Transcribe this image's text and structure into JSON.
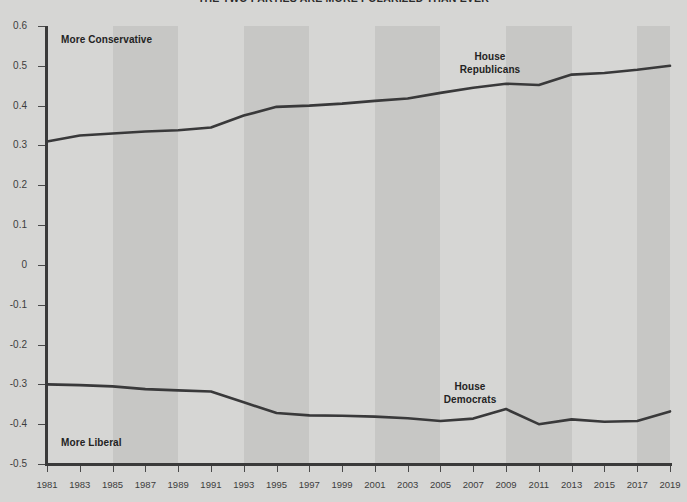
{
  "chart_data": {
    "type": "line",
    "title": "THE TWO PARTIES ARE MORE POLARIZED THAN EVER",
    "xlabel": "",
    "ylabel": "",
    "xlim": [
      1981,
      2019
    ],
    "ylim": [
      -0.5,
      0.6
    ],
    "grid": false,
    "legend_position": "inline-annotation",
    "x": [
      1981,
      1983,
      1985,
      1987,
      1989,
      1991,
      1993,
      1995,
      1997,
      1999,
      2001,
      2003,
      2005,
      2007,
      2009,
      2011,
      2013,
      2015,
      2017,
      2019
    ],
    "xticks": [
      "1981",
      "1983",
      "1985",
      "1987",
      "1989",
      "1991",
      "1993",
      "1995",
      "1997",
      "1999",
      "2001",
      "2003",
      "2005",
      "2007",
      "2009",
      "2011",
      "2013",
      "2015",
      "2017",
      "2019"
    ],
    "yticks": [
      "0.6",
      "0.5",
      "0.4",
      "0.3",
      "0.2",
      "0.1",
      "0",
      "-0.1",
      "-0.2",
      "-0.3",
      "-0.4",
      "-0.5"
    ],
    "ytick_values": [
      0.6,
      0.5,
      0.4,
      0.3,
      0.2,
      0.1,
      0,
      -0.1,
      -0.2,
      -0.3,
      -0.4,
      -0.5
    ],
    "series": [
      {
        "name": "House Republicans",
        "color": "#39393a",
        "values": [
          0.31,
          0.325,
          0.33,
          0.335,
          0.338,
          0.345,
          0.375,
          0.397,
          0.4,
          0.405,
          0.412,
          0.418,
          0.432,
          0.445,
          0.455,
          0.452,
          0.478,
          0.482,
          0.49,
          0.5
        ]
      },
      {
        "name": "House Democrats",
        "color": "#39393a",
        "values": [
          -0.3,
          -0.302,
          -0.305,
          -0.312,
          -0.315,
          -0.318,
          -0.345,
          -0.372,
          -0.378,
          -0.379,
          -0.381,
          -0.385,
          -0.392,
          -0.386,
          -0.362,
          -0.4,
          -0.388,
          -0.394,
          -0.392,
          -0.368
        ]
      }
    ],
    "shaded_bands": [
      {
        "start": 1985,
        "end": 1989
      },
      {
        "start": 1993,
        "end": 1997
      },
      {
        "start": 2001,
        "end": 2005
      },
      {
        "start": 2009,
        "end": 2013
      },
      {
        "start": 2017,
        "end": 2019
      }
    ],
    "annotations": [
      {
        "id": "more_conservative",
        "text": "More Conservative"
      },
      {
        "id": "more_liberal",
        "text": "More Liberal"
      },
      {
        "id": "house_republicans_line1",
        "text": "House"
      },
      {
        "id": "house_republicans_line2",
        "text": "Republicans"
      },
      {
        "id": "house_democrats_line1",
        "text": "House"
      },
      {
        "id": "house_democrats_line2",
        "text": "Democrats"
      }
    ],
    "colors": {
      "background": "#d6d6d4",
      "band": "#c7c7c5",
      "line": "#39393a",
      "axis": "#3a3a3a",
      "text": "#3d3d3d"
    }
  }
}
